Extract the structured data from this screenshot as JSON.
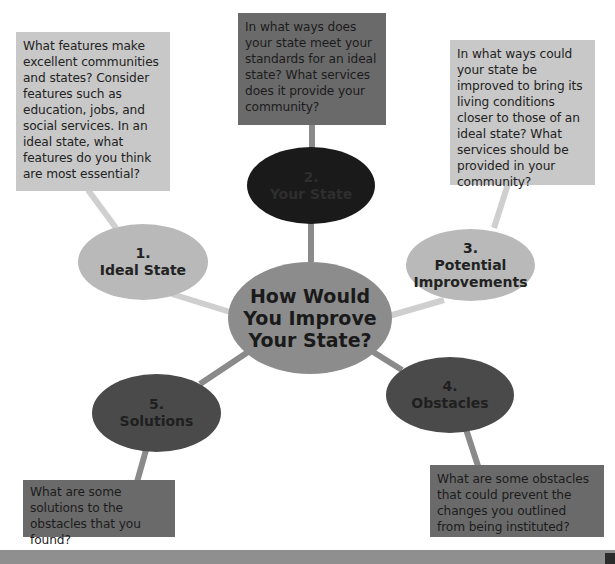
{
  "diagram": {
    "type": "concept-web",
    "colors": {
      "light_box": "#c8c8c8",
      "dark_box": "#6a6a6a",
      "light_node": "#b9b9b9",
      "dark_node": "#4a4a4a",
      "black_node": "#1a1a1a",
      "center_node": "#8c8c8c",
      "bottom_band": "#8f8f8f"
    },
    "center": {
      "title": "How Would You Improve Your State?"
    },
    "nodes": [
      {
        "num": "1.",
        "title": "Ideal State",
        "prompt": "What features make excellent communities and states? Consider features such as education, jobs, and social services. In an ideal state, what features do you think are most essential?"
      },
      {
        "num": "2.",
        "title": "Your State",
        "prompt": "In what ways does your state meet your standards for an ideal state? What services does it provide your community?"
      },
      {
        "num": "3.",
        "title": "Potential Improvements",
        "prompt": "In what ways could your state be improved to bring its living conditions closer to those of an ideal state? What services should be provided in your community?"
      },
      {
        "num": "4.",
        "title": "Obstacles",
        "prompt": "What are some obstacles that could prevent the changes you outlined from being instituted?"
      },
      {
        "num": "5.",
        "title": "Solutions",
        "prompt": "What are some solutions to the obstacles that you found?"
      }
    ]
  }
}
